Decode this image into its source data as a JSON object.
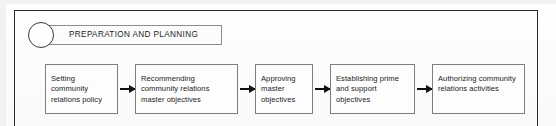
{
  "phase": {
    "number": "1",
    "title": "PREPARATION AND PLANNING"
  },
  "flow": {
    "steps": [
      {
        "id": "step-1",
        "label": "Setting community relations policy"
      },
      {
        "id": "step-2",
        "label": "Recommending community relations master objectives"
      },
      {
        "id": "step-3",
        "label": "Approving master objectives"
      },
      {
        "id": "step-4",
        "label": "Establishing prime and support objectives"
      },
      {
        "id": "step-5",
        "label": "Authorizing community relations activities"
      }
    ],
    "arrow_count": 4,
    "arrow_glyph": "right-arrow"
  },
  "colors": {
    "page_background": "#fdfdfd",
    "frame_border": "#2b2b2b",
    "box_border": "#7e7e7e",
    "title_box_border": "#8d8d8d",
    "text": "#232323",
    "arrow": "#111111"
  }
}
